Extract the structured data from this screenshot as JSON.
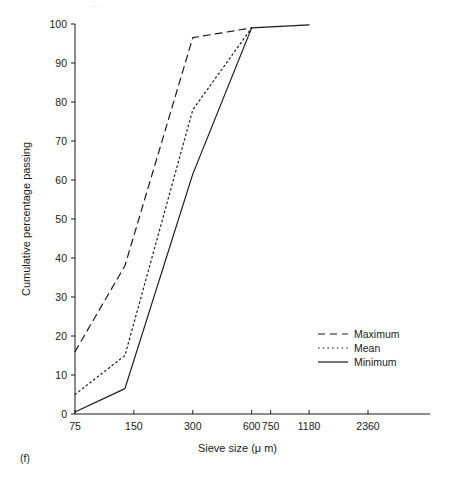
{
  "figure": {
    "panel_label": "(f)",
    "top_artifact": "···"
  },
  "chart_data": {
    "type": "line",
    "title": "",
    "xlabel": "Sieve size (μ m)",
    "ylabel": "Cumulative percentage passing",
    "xscale": "log",
    "xlim": [
      75,
      3350
    ],
    "ylim": [
      0,
      100
    ],
    "grid": false,
    "legend_position": "center-right",
    "x_tick_labels": [
      "75",
      "150",
      "300",
      "600",
      "750",
      "1180",
      "2360"
    ],
    "x_tick_values": [
      75,
      150,
      300,
      600,
      750,
      1180,
      2360
    ],
    "y_tick_labels": [
      "0",
      "10",
      "20",
      "30",
      "40",
      "50",
      "60",
      "70",
      "80",
      "90",
      "100"
    ],
    "y_tick_values": [
      0,
      10,
      20,
      30,
      40,
      50,
      60,
      70,
      80,
      90,
      100
    ],
    "series": [
      {
        "name": "Maximum",
        "style": "dashed",
        "color": "#1a1a1a",
        "x": [
          75,
          135,
          300,
          600
        ],
        "values": [
          16,
          38,
          96.5,
          99
        ]
      },
      {
        "name": "Mean",
        "style": "dotted",
        "color": "#1a1a1a",
        "x": [
          75,
          135,
          300,
          600
        ],
        "values": [
          5,
          15,
          78,
          99
        ]
      },
      {
        "name": "Minimum",
        "style": "solid",
        "color": "#1a1a1a",
        "x": [
          75,
          135,
          300,
          600,
          1180
        ],
        "values": [
          0.5,
          6.5,
          61.5,
          99,
          99.8
        ]
      }
    ]
  },
  "legend": {
    "items": [
      {
        "label": "Maximum",
        "style": "dashed"
      },
      {
        "label": "Mean",
        "style": "dotted"
      },
      {
        "label": "Minimum",
        "style": "solid"
      }
    ]
  }
}
